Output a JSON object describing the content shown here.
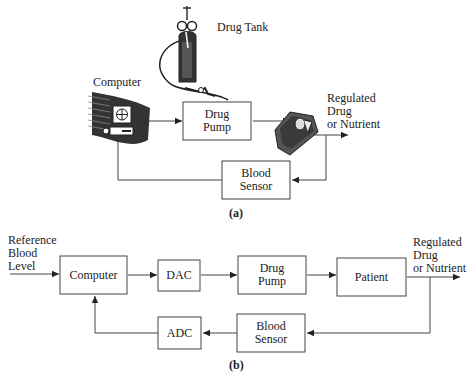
{
  "diagram_a": {
    "caption": "(a)",
    "labels": {
      "drug_tank": "Drug Tank",
      "computer": "Computer",
      "output_line1": "Regulated",
      "output_line2": "Drug",
      "output_line3": "or Nutrient"
    },
    "blocks": {
      "drug_pump_line1": "Drug",
      "drug_pump_line2": "Pump",
      "blood_sensor_line1": "Blood",
      "blood_sensor_line2": "Sensor"
    },
    "icons": [
      "computer-icon",
      "drug-tank-icon",
      "patient-icon"
    ]
  },
  "diagram_b": {
    "caption": "(b)",
    "labels": {
      "input_line1": "Reference",
      "input_line2": "Blood",
      "input_line3": "Level",
      "output_line1": "Regulated",
      "output_line2": "Drug",
      "output_line3": "or Nutrient"
    },
    "blocks": {
      "computer": "Computer",
      "dac": "DAC",
      "drug_pump_line1": "Drug",
      "drug_pump_line2": "Pump",
      "patient": "Patient",
      "adc": "ADC",
      "blood_sensor_line1": "Blood",
      "blood_sensor_line2": "Sensor"
    }
  }
}
